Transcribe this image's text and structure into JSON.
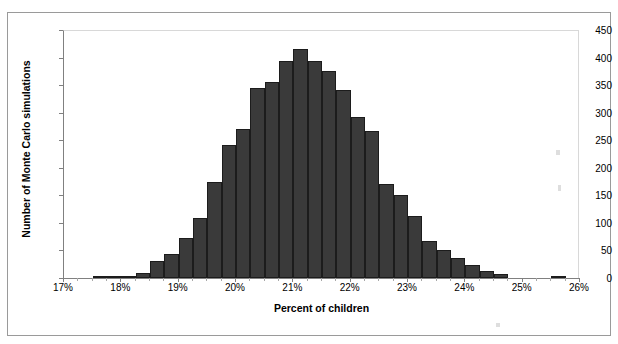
{
  "page": {
    "top_cut_text": "",
    "background_color": "#ffffff",
    "frame_color": "#9a9a9a"
  },
  "chart_data": {
    "type": "bar",
    "title": "",
    "xlabel": "Percent of children",
    "ylabel": "Number of Monte Carlo simulations",
    "xlim": [
      17,
      26
    ],
    "ylim": [
      0,
      450
    ],
    "grid": false,
    "legend": null,
    "bar_color": "#3a3a3a",
    "bar_edge_color": "#1c1c1c",
    "bin_width": 0.25,
    "y_ticks": [
      0,
      50,
      100,
      150,
      200,
      250,
      300,
      350,
      400,
      450
    ],
    "y_tick_labels": [
      "0",
      "50",
      "100",
      "150",
      "200",
      "250",
      "300",
      "350",
      "400",
      "450"
    ],
    "x_ticks": [
      17,
      18,
      19,
      20,
      21,
      22,
      23,
      24,
      25,
      26
    ],
    "x_tick_labels": [
      "17%",
      "18%",
      "19%",
      "20%",
      "21%",
      "22%",
      "23%",
      "24%",
      "25%",
      "26%"
    ],
    "bin_starts": [
      17.5,
      17.75,
      18.0,
      18.25,
      18.5,
      18.75,
      19.0,
      19.25,
      19.5,
      19.75,
      20.0,
      20.25,
      20.5,
      20.75,
      21.0,
      21.25,
      21.5,
      21.75,
      22.0,
      22.25,
      22.5,
      22.75,
      23.0,
      23.25,
      23.5,
      23.75,
      24.0,
      24.25,
      24.5,
      25.5
    ],
    "categories": [
      "17.50%",
      "17.75%",
      "18.00%",
      "18.25%",
      "18.50%",
      "18.75%",
      "19.00%",
      "19.25%",
      "19.50%",
      "19.75%",
      "20.00%",
      "20.25%",
      "20.50%",
      "20.75%",
      "21.00%",
      "21.25%",
      "21.50%",
      "21.75%",
      "22.00%",
      "22.25%",
      "22.50%",
      "22.75%",
      "23.00%",
      "23.25%",
      "23.50%",
      "23.75%",
      "24.00%",
      "24.25%",
      "24.50%",
      "25.50%"
    ],
    "values": [
      2,
      2,
      4,
      9,
      30,
      43,
      72,
      108,
      175,
      242,
      270,
      345,
      356,
      394,
      415,
      394,
      376,
      342,
      292,
      267,
      171,
      150,
      112,
      68,
      50,
      37,
      24,
      13,
      7,
      2
    ]
  }
}
